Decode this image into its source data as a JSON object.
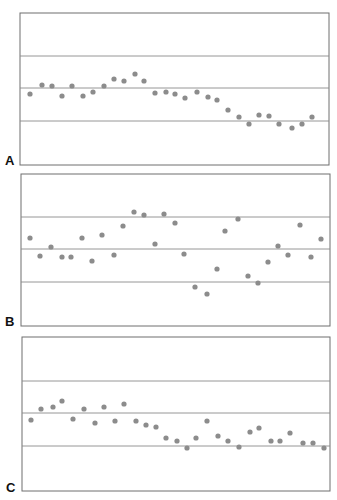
{
  "chart_data": [
    {
      "type": "scatter",
      "title": "",
      "panel_label": "A",
      "xlabel": "",
      "ylabel": "",
      "grid": false,
      "reference_lines": [
        "upper",
        "center",
        "lower"
      ],
      "x": [
        1,
        2,
        3,
        4,
        5,
        6,
        7,
        8,
        9,
        10,
        11,
        12,
        13,
        14,
        15,
        16,
        17,
        18,
        19,
        20,
        21,
        22,
        23,
        24,
        25,
        26,
        27,
        28
      ],
      "values": [
        -0.1,
        0.25,
        0.22,
        -0.15,
        0.24,
        -0.18,
        -0.02,
        0.22,
        0.5,
        0.43,
        0.72,
        0.42,
        -0.06,
        -0.05,
        -0.12,
        -0.31,
        -0.03,
        -0.27,
        -0.36,
        -0.78,
        -1.08,
        -1.36,
        -1.01,
        -1.03,
        -1.36,
        -1.54,
        -1.37,
        -1.08
      ],
      "ylim": [
        -3,
        3
      ],
      "limits": {
        "upper": 1,
        "center": 0,
        "lower": -1
      }
    },
    {
      "type": "scatter",
      "title": "",
      "panel_label": "B",
      "xlabel": "",
      "ylabel": "",
      "grid": false,
      "reference_lines": [
        "upper",
        "center",
        "lower"
      ],
      "x": [
        1,
        2,
        3,
        4,
        5,
        6,
        7,
        8,
        9,
        10,
        11,
        12,
        13,
        14,
        15,
        16,
        17,
        18,
        19,
        20,
        21,
        22,
        23,
        24,
        25,
        26,
        27,
        28,
        29
      ],
      "values": [
        0.37,
        -0.2,
        0.08,
        -0.24,
        -0.25,
        0.34,
        -0.36,
        0.44,
        -0.18,
        0.72,
        1.15,
        1.06,
        0.14,
        1.1,
        0.8,
        -0.17,
        -1.2,
        -1.4,
        -0.63,
        0.57,
        0.94,
        -0.84,
        -1.08,
        -0.41,
        0.08,
        -0.2,
        0.74,
        -0.25,
        0.3
      ],
      "ylim": [
        -3,
        3
      ],
      "limits": {
        "upper": 1,
        "center": 0,
        "lower": -1
      }
    },
    {
      "type": "scatter",
      "title": "",
      "panel_label": "C",
      "xlabel": "",
      "ylabel": "",
      "grid": false,
      "reference_lines": [
        "upper",
        "center",
        "lower"
      ],
      "x": [
        1,
        2,
        3,
        4,
        5,
        6,
        7,
        8,
        9,
        10,
        11,
        12,
        13,
        14,
        15,
        16,
        17,
        18,
        19,
        20,
        21,
        22,
        23,
        24,
        25,
        26,
        27,
        28,
        29
      ],
      "values": [
        -0.17,
        0.18,
        0.22,
        0.4,
        -0.15,
        0.18,
        -0.26,
        0.24,
        -0.21,
        0.32,
        -0.2,
        -0.33,
        -0.38,
        -0.73,
        -0.81,
        -1.04,
        -0.73,
        -0.2,
        -0.67,
        -0.81,
        -1.02,
        -0.54,
        -0.42,
        -0.81,
        -0.81,
        -0.57,
        -0.88,
        -0.88,
        -1.02
      ],
      "ylim": [
        -3,
        3
      ],
      "limits": {
        "upper": 1,
        "center": 0,
        "lower": -1
      }
    }
  ],
  "panels": [
    {
      "label": "A",
      "box": {
        "x": 20,
        "y": 13,
        "w": 309,
        "h": 152
      },
      "lines_y": [
        56,
        88,
        121
      ]
    },
    {
      "label": "B",
      "box": {
        "x": 21,
        "y": 174,
        "w": 309,
        "h": 152
      },
      "lines_y": [
        217,
        249,
        282
      ]
    },
    {
      "label": "C",
      "box": {
        "x": 22,
        "y": 337,
        "w": 308,
        "h": 154
      },
      "lines_y": [
        381,
        413,
        446
      ]
    }
  ],
  "points_px": [
    [
      [
        30,
        94
      ],
      [
        42,
        85
      ],
      [
        52,
        86
      ],
      [
        62,
        96
      ],
      [
        72,
        86
      ],
      [
        83,
        96
      ],
      [
        93,
        92
      ],
      [
        104,
        86
      ],
      [
        114,
        79
      ],
      [
        124,
        81
      ],
      [
        135,
        74
      ],
      [
        144,
        81
      ],
      [
        155,
        93
      ],
      [
        166,
        92
      ],
      [
        175,
        94
      ],
      [
        185,
        98
      ],
      [
        197,
        92
      ],
      [
        208,
        97
      ],
      [
        217,
        100
      ],
      [
        228,
        110
      ],
      [
        239,
        117
      ],
      [
        249,
        124
      ],
      [
        259,
        115
      ],
      [
        269,
        116
      ],
      [
        279,
        124
      ],
      [
        292,
        128
      ],
      [
        302,
        124
      ],
      [
        312,
        117
      ]
    ],
    [
      [
        30,
        238
      ],
      [
        40,
        256
      ],
      [
        51,
        247
      ],
      [
        62,
        257
      ],
      [
        71,
        257
      ],
      [
        82,
        238
      ],
      [
        92,
        261
      ],
      [
        102,
        235
      ],
      [
        114,
        255
      ],
      [
        123,
        226
      ],
      [
        134,
        212
      ],
      [
        144,
        215
      ],
      [
        155,
        244
      ],
      [
        164,
        214
      ],
      [
        175,
        223
      ],
      [
        184,
        254
      ],
      [
        195,
        287
      ],
      [
        207,
        294
      ],
      [
        217,
        269
      ],
      [
        225,
        231
      ],
      [
        238,
        219
      ],
      [
        248,
        276
      ],
      [
        258,
        283
      ],
      [
        268,
        262
      ],
      [
        278,
        246
      ],
      [
        288,
        255
      ],
      [
        300,
        225
      ],
      [
        311,
        257
      ],
      [
        321,
        239
      ]
    ],
    [
      [
        31,
        420
      ],
      [
        41,
        409
      ],
      [
        53,
        407
      ],
      [
        62,
        401
      ],
      [
        73,
        419
      ],
      [
        84,
        409
      ],
      [
        95,
        423
      ],
      [
        104,
        407
      ],
      [
        115,
        421
      ],
      [
        124,
        404
      ],
      [
        136,
        421
      ],
      [
        146,
        425
      ],
      [
        156,
        427
      ],
      [
        166,
        438
      ],
      [
        177,
        441
      ],
      [
        187,
        448
      ],
      [
        196,
        438
      ],
      [
        207,
        421
      ],
      [
        218,
        436
      ],
      [
        228,
        441
      ],
      [
        239,
        447
      ],
      [
        250,
        432
      ],
      [
        259,
        428
      ],
      [
        271,
        441
      ],
      [
        280,
        441
      ],
      [
        290,
        433
      ],
      [
        303,
        443
      ],
      [
        313,
        443
      ],
      [
        324,
        448
      ]
    ]
  ],
  "style": {
    "dot_color": "#8c8c8c",
    "line_color": "#8a8a8a",
    "border_color": "#6e6e6e",
    "label_color": "#111111"
  }
}
